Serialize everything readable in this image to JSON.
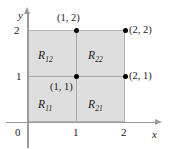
{
  "figure": {
    "colors": {
      "shading": "#dedede",
      "axis": "#9a9a9a",
      "grid": "#a8a8a8",
      "dot": "#000000",
      "text": "#1a1a1a",
      "background": "#ffffff"
    }
  },
  "axes": {
    "x": {
      "name": "x",
      "ticks": [
        "1",
        "2"
      ],
      "origin_label": "0"
    },
    "y": {
      "name": "y",
      "ticks": [
        "1",
        "2"
      ]
    }
  },
  "regions": [
    {
      "name": "R12",
      "base": "R",
      "subscript": "12"
    },
    {
      "name": "R22",
      "base": "R",
      "subscript": "22"
    },
    {
      "name": "R11",
      "base": "R",
      "subscript": "11"
    },
    {
      "name": "R21",
      "base": "R",
      "subscript": "21"
    }
  ],
  "points": [
    {
      "id": "p12",
      "label": "(1, 2)",
      "x": 1,
      "y": 2
    },
    {
      "id": "p22",
      "label": "(2, 2)",
      "x": 2,
      "y": 2
    },
    {
      "id": "p11",
      "label": "(1, 1)",
      "x": 1,
      "y": 1
    },
    {
      "id": "p21",
      "label": "(2, 1)",
      "x": 2,
      "y": 1
    }
  ],
  "chart_data": {
    "type": "scatter",
    "title": "",
    "xlabel": "x",
    "ylabel": "y",
    "xlim": [
      0,
      2.4
    ],
    "ylim": [
      0,
      2.4
    ],
    "xticks": [
      0,
      1,
      2
    ],
    "yticks": [
      1,
      2
    ],
    "grid": true,
    "shaded_rect": {
      "x0": 0,
      "y0": 0,
      "x1": 2,
      "y1": 2
    },
    "subregions": [
      {
        "label": "R11",
        "x0": 0,
        "y0": 0,
        "x1": 1,
        "y1": 1
      },
      {
        "label": "R21",
        "x0": 1,
        "y0": 0,
        "x1": 2,
        "y1": 1
      },
      {
        "label": "R12",
        "x0": 0,
        "y0": 1,
        "x1": 1,
        "y1": 2
      },
      {
        "label": "R22",
        "x0": 1,
        "y0": 1,
        "x1": 2,
        "y1": 2
      }
    ],
    "points": [
      {
        "x": 1,
        "y": 2,
        "label": "(1, 2)"
      },
      {
        "x": 2,
        "y": 2,
        "label": "(2, 2)"
      },
      {
        "x": 1,
        "y": 1,
        "label": "(1, 1)"
      },
      {
        "x": 2,
        "y": 1,
        "label": "(2, 1)"
      }
    ]
  }
}
